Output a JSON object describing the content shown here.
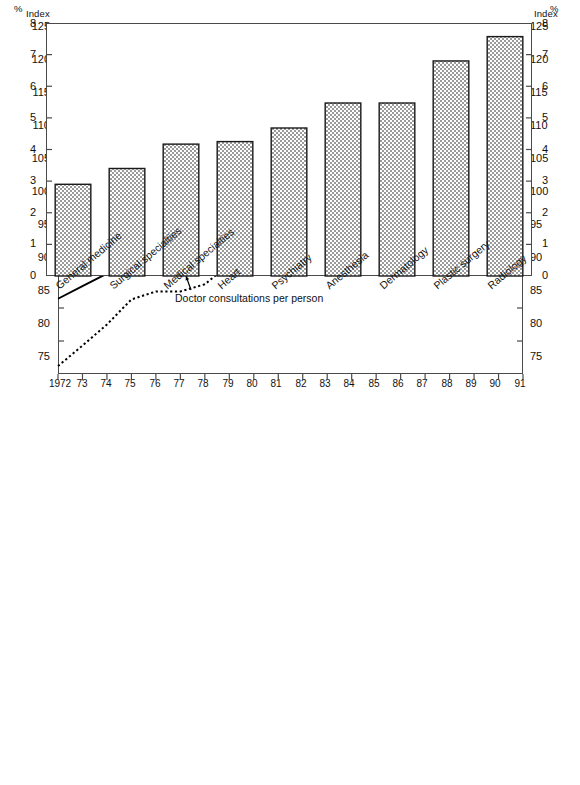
{
  "top_chart": {
    "axis_unit_left": "Index",
    "axis_unit_right": "Index",
    "base_note": "1980 = 100",
    "annotations": {
      "physicians_line1": "Number of physicians",
      "physicians_line2": "practicing per capita",
      "consultations": "Doctor consultations per person",
      "income": "Physicians' relative income",
      "income_footnote": "1"
    },
    "y_ticks": [
      "125",
      "120",
      "115",
      "110",
      "105",
      "100",
      "95",
      "90",
      "85",
      "80",
      "75"
    ],
    "x_ticks": [
      "1972",
      "73",
      "74",
      "75",
      "76",
      "77",
      "78",
      "79",
      "80",
      "81",
      "82",
      "83",
      "84",
      "85",
      "86",
      "87",
      "88",
      "89",
      "90",
      "91"
    ]
  },
  "bottom_chart": {
    "axis_unit_left": "%",
    "axis_unit_right": "%",
    "title": "Growth in the number of services offered by physician",
    "subtitle": "1983-1988, average annual percentage growth",
    "y_ticks": [
      "8",
      "7",
      "6",
      "5",
      "4",
      "3",
      "2",
      "1",
      "0"
    ]
  },
  "chart_data": [
    {
      "type": "line",
      "title": "Index of physician supply, consultations and relative income",
      "xlabel": "",
      "ylabel": "Index",
      "ylim": [
        75,
        125
      ],
      "grid": false,
      "legend_position": "inline-annotations",
      "note": "1980 = 100",
      "x": [
        1972,
        1973,
        1974,
        1975,
        1976,
        1977,
        1978,
        1979,
        1980,
        1981,
        1982,
        1983,
        1984,
        1985,
        1986,
        1987,
        1988,
        1989,
        1990,
        1991
      ],
      "series": [
        {
          "name": "Number of physicians practicing per capita",
          "style": "solid",
          "values": [
            86.4,
            88.3,
            90.2,
            92.0,
            93.8,
            94.6,
            96.4,
            98.4,
            100.0,
            102.4,
            104.4,
            106.4,
            108.6,
            110.8,
            113.4,
            115.8,
            118.6,
            119.8,
            119.2,
            119.8
          ]
        },
        {
          "name": "Doctor consultations per person",
          "style": "dotted",
          "values": [
            76.2,
            79.3,
            82.5,
            86.3,
            87.5,
            87.5,
            88.6,
            91.6,
            100.0,
            102.2,
            104.0,
            106.0,
            109.8,
            110.2,
            112.6,
            115.8,
            118.4,
            120.6,
            122.2,
            123.4
          ]
        },
        {
          "name": "Physicians' relative income",
          "style": "dashed",
          "values": [
            null,
            null,
            null,
            null,
            null,
            null,
            null,
            null,
            100.0,
            103.4,
            106.2,
            112.8,
            116.6,
            108.8,
            106.6,
            104.6,
            104.0,
            105.2,
            104.2,
            104.2
          ]
        }
      ]
    },
    {
      "type": "bar",
      "title": "Growth in the number of services offered by physician",
      "subtitle": "1983-1988, average annual percentage growth",
      "xlabel": "",
      "ylabel": "%",
      "ylim": [
        0,
        8
      ],
      "grid": false,
      "categories": [
        "General medicine",
        "Surgical specialties",
        "Medical specialties",
        "Heart",
        "Psychiatry",
        "Anesthesia",
        "Dermatology",
        "Plastic surgery",
        "Radiology"
      ],
      "values": [
        2.9,
        3.4,
        4.17,
        4.25,
        4.68,
        5.47,
        5.47,
        6.8,
        7.57
      ]
    }
  ]
}
